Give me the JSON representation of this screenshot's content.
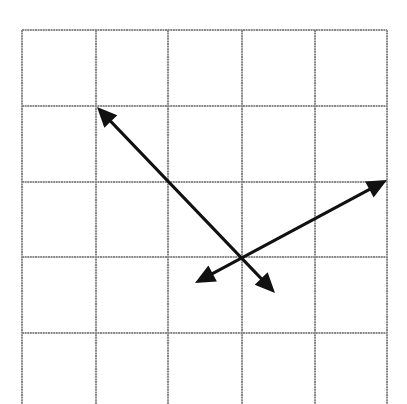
{
  "diagram": {
    "type": "vector-grid",
    "colors": {
      "background": "#ffffff",
      "grid": "#8a8a8a",
      "arrow": "#111111"
    },
    "grid": {
      "vertical_lines_x": [
        22,
        96,
        168,
        242,
        315,
        387
      ],
      "horizontal_lines_y": [
        30,
        106,
        182,
        257,
        333
      ],
      "top": 30,
      "bottom": 404,
      "left": 22,
      "right": 387
    },
    "intersection": {
      "x": 241,
      "y": 257
    },
    "arrows": [
      {
        "name": "arrow-a",
        "from": {
          "x": 97,
          "y": 107
        },
        "to": {
          "x": 275,
          "y": 293
        }
      },
      {
        "name": "arrow-b",
        "from": {
          "x": 195,
          "y": 283
        },
        "to": {
          "x": 387,
          "y": 180
        }
      }
    ]
  }
}
